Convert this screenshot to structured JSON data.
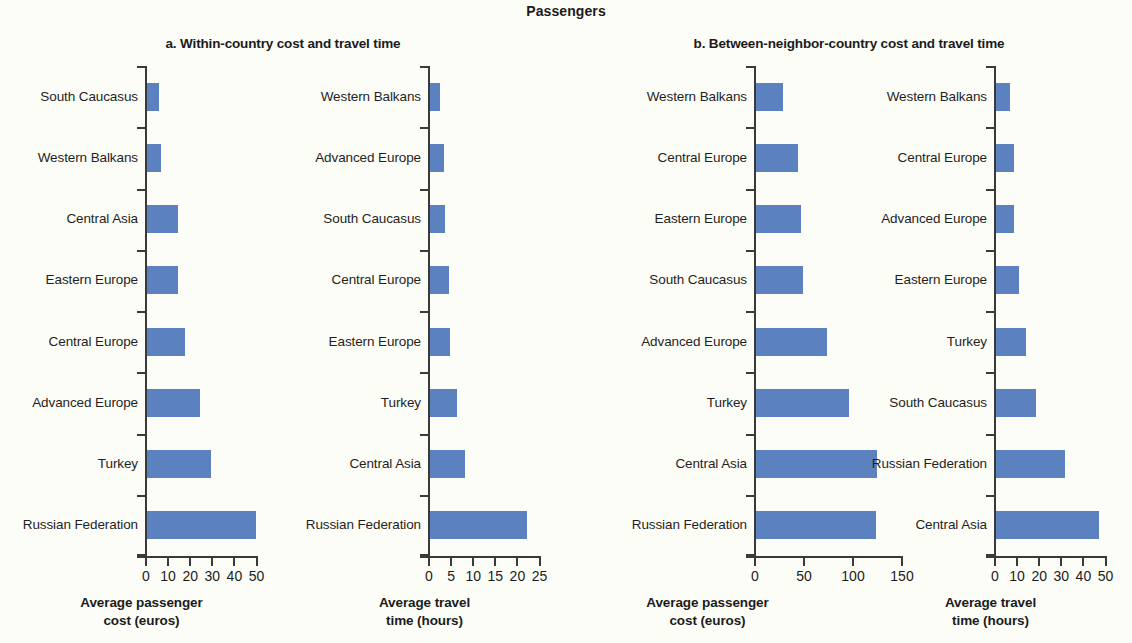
{
  "figure": {
    "title": "Passengers"
  },
  "panels": [
    {
      "id": "a",
      "title": "a. Within-country cost and travel time"
    },
    {
      "id": "b",
      "title": "b. Between-neighbor-country cost and travel time"
    }
  ],
  "chart_data": [
    {
      "type": "bar",
      "orientation": "horizontal",
      "panel": "a",
      "title": "a. Within-country cost and travel time",
      "subplot": "a1",
      "xlabel_line1": "Average passenger",
      "xlabel_line2": "cost (euros)",
      "ylabel": "",
      "xlim": [
        0,
        50
      ],
      "xticks": [
        0,
        10,
        20,
        30,
        40,
        50
      ],
      "xticklabels": [
        "0",
        "10",
        "20",
        "30",
        "40",
        "50"
      ],
      "grid": false,
      "legend": "none",
      "bar_color": "#5b82bf",
      "categories": [
        "South Caucasus",
        "Western Balkans",
        "Central Asia",
        "Eastern Europe",
        "Central Europe",
        "Advanced Europe",
        "Turkey",
        "Russian Federation"
      ],
      "values": [
        5.5,
        6.5,
        14,
        14,
        17,
        24,
        29,
        49.5
      ]
    },
    {
      "type": "bar",
      "orientation": "horizontal",
      "panel": "a",
      "title": "a. Within-country cost and travel time",
      "subplot": "a2",
      "xlabel_line1": "Average travel",
      "xlabel_line2": "time (hours)",
      "ylabel": "",
      "xlim": [
        0,
        25
      ],
      "xticks": [
        0,
        5,
        10,
        15,
        20,
        25
      ],
      "xticklabels": [
        "0",
        "5",
        "10",
        "15",
        "20",
        "25"
      ],
      "grid": false,
      "legend": "none",
      "bar_color": "#5b82bf",
      "categories": [
        "Western Balkans",
        "Advanced Europe",
        "South Caucasus",
        "Central Europe",
        "Eastern Europe",
        "Turkey",
        "Central Asia",
        "Russian Federation"
      ],
      "values": [
        2.2,
        3.2,
        3.4,
        4.3,
        4.6,
        6.2,
        8.0,
        22.0
      ]
    },
    {
      "type": "bar",
      "orientation": "horizontal",
      "panel": "b",
      "title": "b. Between-neighbor-country cost and travel time",
      "subplot": "b1",
      "xlabel_line1": "Average passenger",
      "xlabel_line2": "cost (euros)",
      "ylabel": "",
      "xlim": [
        0,
        150
      ],
      "xticks": [
        0,
        50,
        100,
        150
      ],
      "xticklabels": [
        "0",
        "50",
        "100",
        "150"
      ],
      "grid": false,
      "legend": "none",
      "bar_color": "#5b82bf",
      "categories": [
        "Western Balkans",
        "Central Europe",
        "Eastern Europe",
        "South Caucasus",
        "Advanced Europe",
        "Turkey",
        "Central Asia",
        "Russian Federation"
      ],
      "values": [
        28,
        43,
        46,
        48,
        72,
        95,
        123,
        122
      ]
    },
    {
      "type": "bar",
      "orientation": "horizontal",
      "panel": "b",
      "title": "b. Between-neighbor-country cost and travel time",
      "subplot": "b2",
      "xlabel_line1": "Average travel",
      "xlabel_line2": "time (hours)",
      "ylabel": "",
      "xlim": [
        0,
        50
      ],
      "xticks": [
        0,
        10,
        20,
        30,
        40,
        50
      ],
      "xticklabels": [
        "0",
        "10",
        "20",
        "30",
        "40",
        "50"
      ],
      "grid": false,
      "legend": "none",
      "bar_color": "#5b82bf",
      "categories": [
        "Western Balkans",
        "Central Europe",
        "Advanced Europe",
        "Eastern Europe",
        "Turkey",
        "South Caucasus",
        "Russian Federation",
        "Central Asia"
      ],
      "values": [
        6.5,
        8.0,
        8.3,
        10.5,
        13.5,
        18.0,
        31.0,
        46.5
      ]
    }
  ]
}
